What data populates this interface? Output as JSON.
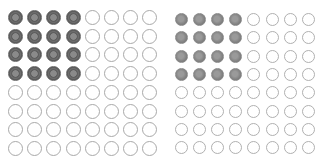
{
  "figure": {
    "colors": {
      "left_filled": "#5a5a5a",
      "right_filled": "#7c7c7c",
      "empty_stroke": "#a9a9a9",
      "background": "#ffffff"
    },
    "grids": [
      {
        "name": "left-grid",
        "rows": 8,
        "cols": 8,
        "filled_rows": 4,
        "filled_cols": 4,
        "style": "ringed",
        "origin_x": 8,
        "origin_y": 10,
        "step_x": 19.2,
        "step_y": 18.7
      },
      {
        "name": "right-grid",
        "rows": 8,
        "cols": 8,
        "filled_rows": 4,
        "filled_cols": 4,
        "style": "solid",
        "origin_x": 175,
        "origin_y": 13,
        "step_x": 18.1,
        "step_y": 18.3
      }
    ]
  }
}
